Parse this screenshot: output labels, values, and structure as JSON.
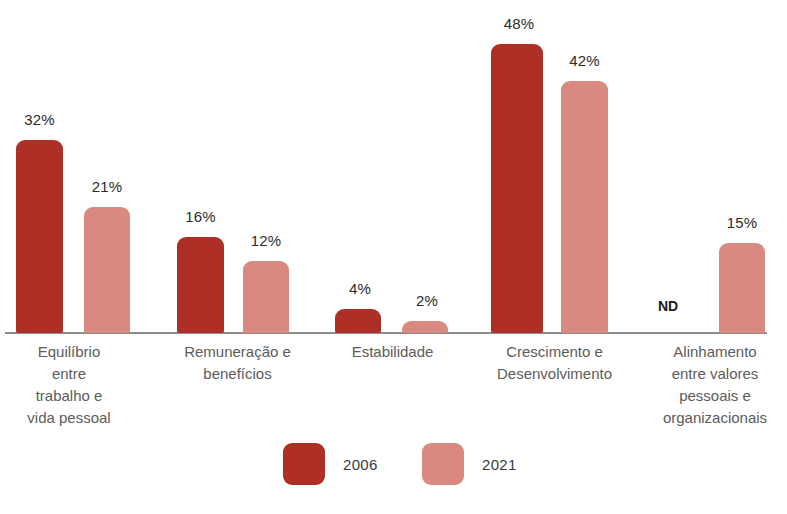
{
  "chart_data": {
    "type": "bar",
    "title": "",
    "xlabel": "",
    "ylabel": "",
    "ylim": [
      0,
      55
    ],
    "grid": false,
    "legend_position": "bottom",
    "categories": [
      "Equilíbrio\nentre\ntrabalho e\nvida pessoal",
      "Remuneração e\nbenefícios",
      "Estabilidade",
      "Crescimento e\nDesenvolvimento",
      "Alinhamento\nentre valores\npessoais e\norganizacionais"
    ],
    "series": [
      {
        "name": "2006",
        "color": "#ad2f26",
        "values": [
          32,
          16,
          4,
          48,
          null
        ],
        "labels": [
          "32%",
          "16%",
          "4%",
          "48%",
          "ND"
        ]
      },
      {
        "name": "2021",
        "color": "#d9897f",
        "values": [
          21,
          12,
          2,
          42,
          15
        ],
        "labels": [
          "21%",
          "12%",
          "2%",
          "42%",
          "15%"
        ]
      }
    ],
    "missing_value_label": "ND"
  },
  "legend": {
    "items": [
      {
        "label": "2006",
        "color": "#ad2f26"
      },
      {
        "label": "2021",
        "color": "#d9897f"
      }
    ]
  },
  "bars": [
    {
      "name": "bar-2006-equilibrio",
      "label": "32%",
      "series": "2006",
      "value": 32,
      "left": 16,
      "width": 47,
      "top": 140,
      "label_left": 4,
      "label_top": 111
    },
    {
      "name": "bar-2021-equilibrio",
      "label": "21%",
      "series": "2021",
      "value": 21,
      "left": 84,
      "width": 46,
      "top": 207,
      "label_left": 72,
      "label_top": 178
    },
    {
      "name": "bar-2006-remuneracao",
      "label": "16%",
      "series": "2006",
      "value": 16,
      "left": 177,
      "width": 47,
      "top": 237,
      "label_left": 165,
      "label_top": 208
    },
    {
      "name": "bar-2021-remuneracao",
      "label": "12%",
      "series": "2021",
      "value": 12,
      "left": 243,
      "width": 46,
      "top": 261,
      "label_left": 231,
      "label_top": 232
    },
    {
      "name": "bar-2006-estabilidade",
      "label": "4%",
      "series": "2006",
      "value": 4,
      "left": 335,
      "width": 46,
      "top": 309,
      "label_left": 325,
      "label_top": 280
    },
    {
      "name": "bar-2021-estabilidade",
      "label": "2%",
      "series": "2021",
      "value": 2,
      "left": 402,
      "width": 46,
      "top": 321,
      "label_left": 392,
      "label_top": 292
    },
    {
      "name": "bar-2006-crescimento",
      "label": "48%",
      "series": "2006",
      "value": 48,
      "left": 491,
      "width": 52,
      "top": 44,
      "label_left": 481,
      "label_top": 15
    },
    {
      "name": "bar-2021-crescimento",
      "label": "42%",
      "series": "2021",
      "value": 42,
      "left": 561,
      "width": 47,
      "top": 81,
      "label_left": 549,
      "label_top": 52
    },
    {
      "name": "bar-2021-alinhamento",
      "label": "15%",
      "series": "2021",
      "value": 15,
      "left": 719,
      "width": 46,
      "top": 243,
      "label_left": 707,
      "label_top": 214
    }
  ],
  "nd_marker": {
    "label": "ND",
    "left": 637,
    "top": 298,
    "width": 62
  },
  "category_labels": [
    {
      "name": "category-label-equilibrio",
      "text": "Equilíbrio\nentre\ntrabalho e\nvida pessoal",
      "left": 8,
      "width": 122
    },
    {
      "name": "category-label-remuneracao",
      "text": "Remuneração e\nbenefícios",
      "left": 160,
      "width": 155
    },
    {
      "name": "category-label-estabilidade",
      "text": "Estabilidade",
      "left": 325,
      "width": 135
    },
    {
      "name": "category-label-crescimento",
      "text": "Crescimento e\nDesenvolvimento",
      "left": 472,
      "width": 165
    },
    {
      "name": "category-label-alinhamento",
      "text": "Alinhamento\nentre valores\npessoais e\norganizacionais",
      "left": 645,
      "width": 140
    }
  ],
  "legend_layout": [
    {
      "left": 283,
      "text_key": 0
    },
    {
      "left": 422,
      "text_key": 1
    }
  ]
}
